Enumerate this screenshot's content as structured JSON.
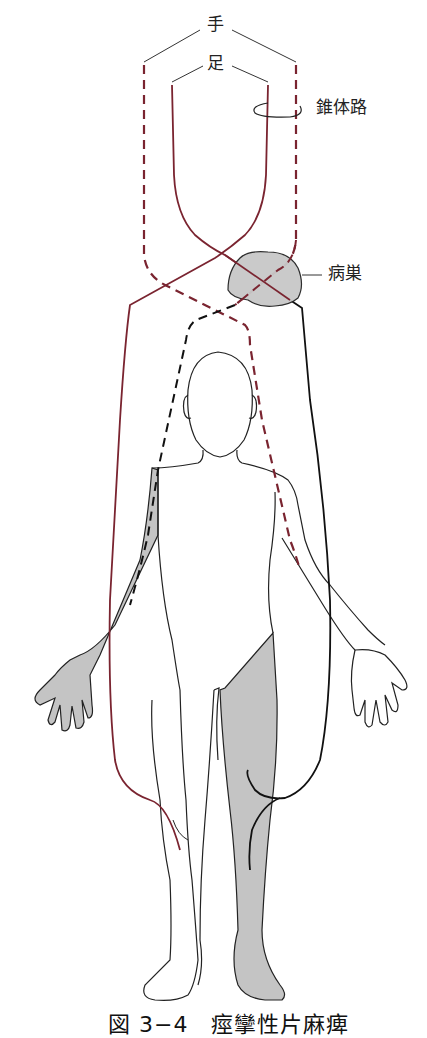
{
  "labels": {
    "hand": "手",
    "foot": "足",
    "pyramidal_tract": "錐体路",
    "lesion": "病巣"
  },
  "caption": "図 3−4　痙攣性片麻痺",
  "colors": {
    "foot_tract": "#7a2430",
    "hand_tract": "#7a2430",
    "efferent_black": "#111111",
    "paralysis_fill": "#c4c4c4",
    "lesion_fill": "#c8c8c8",
    "outline": "#222222"
  },
  "legend": {
    "solid_line": "足 (foot) fibers",
    "dashed_line": "手 (hand) fibers"
  }
}
